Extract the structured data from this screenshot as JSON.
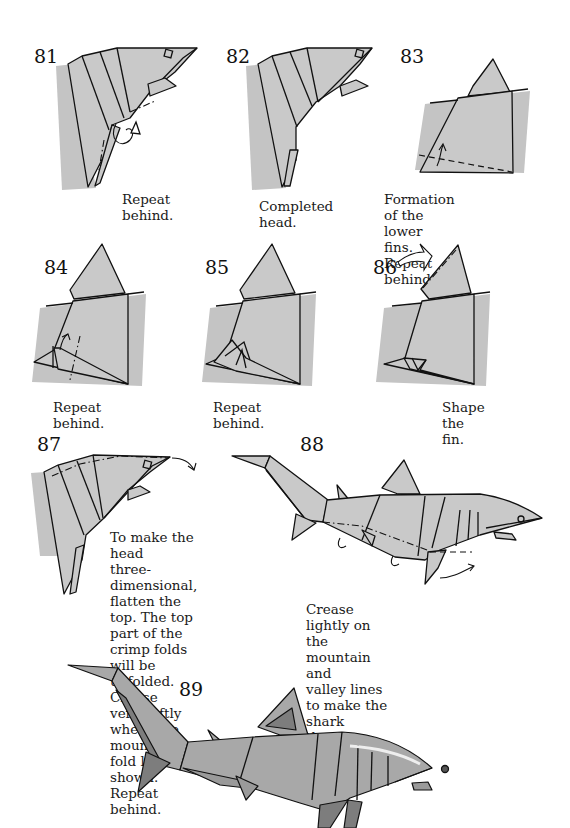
{
  "page": {
    "colors": {
      "paper": "#c9c9c9",
      "paper_shaded": "#9a9a9a",
      "line": "#111111",
      "background": "#ffffff"
    }
  },
  "steps": [
    {
      "number": "81",
      "caption": "Repeat behind."
    },
    {
      "number": "82",
      "caption": "Completed head."
    },
    {
      "number": "83",
      "caption": "Formation of the lower fins. Repeat behind."
    },
    {
      "number": "84",
      "caption": "Repeat behind."
    },
    {
      "number": "85",
      "caption": "Repeat behind."
    },
    {
      "number": "86",
      "caption": "Shape the fin."
    },
    {
      "number": "87",
      "caption_lines": [
        "To make the head",
        "three-dimensional,",
        "flatten the top. The top",
        "part of the crimp folds",
        "will be unfolded. Crease",
        "very softly where the",
        "mountain fold line is",
        "shown. Repeat behind."
      ]
    },
    {
      "number": "88",
      "caption_lines": [
        "Crease lightly on the mountain and",
        "valley lines to make the shark",
        "three-dimensional. Repeat behind."
      ]
    },
    {
      "number": "89",
      "caption": ""
    }
  ],
  "captions83": [
    "Formation of the lower",
    "fins. Repeat behind."
  ]
}
